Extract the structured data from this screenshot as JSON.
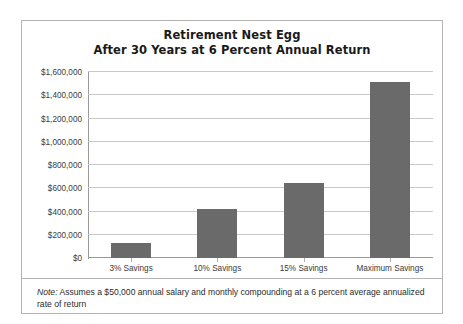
{
  "chart_data": {
    "type": "bar",
    "title": "Retirement Nest Egg\nAfter 30 Years at 6 Percent Annual Return",
    "title_lines": [
      "Retirement Nest Egg",
      "After 30 Years at 6 Percent Annual Return"
    ],
    "categories": [
      "3% Savings",
      "10% Savings",
      "15% Savings",
      "Maximum Savings"
    ],
    "values": [
      129000,
      425000,
      645000,
      1510000
    ],
    "series": [
      {
        "name": "Retirement Nest Egg",
        "values": [
          129000,
          425000,
          645000,
          1510000
        ]
      }
    ],
    "xlabel": "",
    "ylabel": "",
    "ylim": [
      0,
      1600000
    ],
    "ytick_values": [
      0,
      200000,
      400000,
      600000,
      800000,
      1000000,
      1200000,
      1400000,
      1600000
    ],
    "ytick_labels": [
      "$0",
      "$200,000",
      "$400,000",
      "$600,000",
      "$800,000",
      "$1,000,000",
      "$1,200,000",
      "$1,400,000",
      "$1,600,000"
    ],
    "grid": true,
    "legend": false,
    "legend_position": "none",
    "bar_color": "#6a6a6a",
    "gridline_color": "#c9c9c9",
    "axis_color": "#9a9a9a",
    "border_color": "#b4b4b4",
    "background": "#ffffff",
    "annotations": [
      {
        "name": "footnote",
        "label": "Note:",
        "text": "Assumes a $50,000 annual salary and monthly compounding at a 6 percent average annualized rate of return"
      }
    ]
  },
  "note": {
    "label": "Note:",
    "text": " Assumes a $50,000 annual salary and monthly compounding at a 6 percent average annualized rate of return"
  }
}
